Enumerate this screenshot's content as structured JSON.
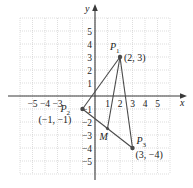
{
  "diagram": {
    "type": "coordinate-plane",
    "axes": {
      "x_label": "x",
      "y_label": "y",
      "x_ticks": [
        "−5",
        "−4",
        "−3",
        "1",
        "2",
        "3",
        "4",
        "5"
      ],
      "x_tick_values": [
        -5,
        -4,
        -3,
        1,
        2,
        3,
        4,
        5
      ],
      "y_ticks": [
        "5",
        "4",
        "3",
        "2",
        "1",
        "−1",
        "−2",
        "−3",
        "−4",
        "−5"
      ],
      "y_tick_values": [
        5,
        4,
        3,
        2,
        1,
        -1,
        -2,
        -3,
        -4,
        -5
      ],
      "range": {
        "x": [
          -6,
          6
        ],
        "y": [
          -6,
          6
        ]
      }
    },
    "points": [
      {
        "id": "P1",
        "name": "P",
        "sub": "1",
        "coords_label": "(2, 3)",
        "x": 2,
        "y": 3
      },
      {
        "id": "P2",
        "name": "P",
        "sub": "2",
        "coords_label": "(−1, −1)",
        "x": -1,
        "y": -1
      },
      {
        "id": "P3",
        "name": "P",
        "sub": "3",
        "coords_label": "(3, −4)",
        "x": 3,
        "y": -4
      },
      {
        "id": "M",
        "name": "M",
        "sub": "",
        "coords_label": "",
        "x": 1,
        "y": -2.5
      }
    ],
    "segments": [
      {
        "from": "P1",
        "to": "P2"
      },
      {
        "from": "P2",
        "to": "P3"
      },
      {
        "from": "P1",
        "to": "P3"
      },
      {
        "from": "P1",
        "to": "M"
      }
    ],
    "colors": {
      "line": "#4a4a4a",
      "grid": "#c8c8c8",
      "axis": "#3a3a3a"
    }
  }
}
